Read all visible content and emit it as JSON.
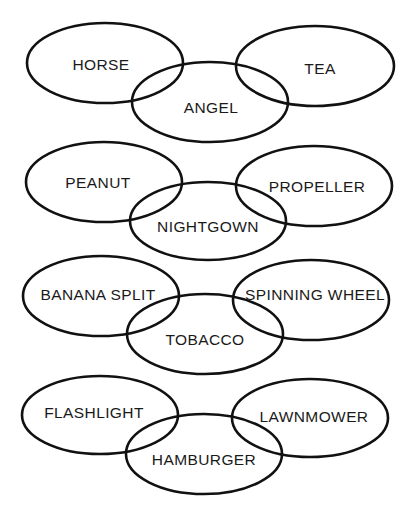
{
  "diagram": {
    "stroke_color": "#111111",
    "background": "#ffffff",
    "groups": [
      {
        "ellipses": [
          {
            "label": "HORSE",
            "cx": 105,
            "cy": 63,
            "rx": 78,
            "ry": 40,
            "tx": 101,
            "ty": 70
          },
          {
            "label": "TEA",
            "cx": 315,
            "cy": 66,
            "rx": 79,
            "ry": 40,
            "tx": 320,
            "ty": 74
          },
          {
            "label": "ANGEL",
            "cx": 210,
            "cy": 102,
            "rx": 78,
            "ry": 40,
            "tx": 211,
            "ty": 113
          }
        ]
      },
      {
        "ellipses": [
          {
            "label": "PEANUT",
            "cx": 104,
            "cy": 182,
            "rx": 78,
            "ry": 40,
            "tx": 98,
            "ty": 188
          },
          {
            "label": "PROPELLER",
            "cx": 314,
            "cy": 186,
            "rx": 78,
            "ry": 40,
            "tx": 317,
            "ty": 192
          },
          {
            "label": "NIGHTGOWN",
            "cx": 208,
            "cy": 221,
            "rx": 78,
            "ry": 39,
            "tx": 208,
            "ty": 232
          }
        ]
      },
      {
        "ellipses": [
          {
            "label": "BANANA SPLIT",
            "cx": 101,
            "cy": 296,
            "rx": 78,
            "ry": 40,
            "tx": 98,
            "ty": 300
          },
          {
            "label": "SPINNING WHEEL",
            "cx": 311,
            "cy": 300,
            "rx": 78,
            "ry": 40,
            "tx": 315,
            "ty": 300
          },
          {
            "label": "TOBACCO",
            "cx": 205,
            "cy": 334,
            "rx": 78,
            "ry": 40,
            "tx": 205,
            "ty": 345
          }
        ]
      },
      {
        "ellipses": [
          {
            "label": "FLASHLIGHT",
            "cx": 100,
            "cy": 415,
            "rx": 78,
            "ry": 39,
            "tx": 94,
            "ty": 418
          },
          {
            "label": "LAWNMOWER",
            "cx": 310,
            "cy": 418,
            "rx": 78,
            "ry": 39,
            "tx": 314,
            "ty": 422
          },
          {
            "label": "HAMBURGER",
            "cx": 204,
            "cy": 454,
            "rx": 78,
            "ry": 40,
            "tx": 204,
            "ty": 465
          }
        ]
      }
    ]
  }
}
